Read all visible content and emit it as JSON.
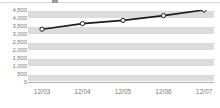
{
  "chart_data": {
    "type": "line",
    "title": "",
    "xlabel": "",
    "ylabel": "",
    "categories": [
      "12/03",
      "12/04",
      "12/05",
      "12/06",
      "12/07"
    ],
    "values": [
      3300,
      3650,
      3850,
      4150,
      4500
    ],
    "series": [
      {
        "name": "",
        "values": [
          3300,
          3650,
          3850,
          4150,
          4500
        ]
      }
    ],
    "ylim": [
      0,
      4500
    ],
    "ytick_labels": [
      "4,500",
      "4,000",
      "3,500",
      "3,000",
      "2,500",
      "2,000",
      "1,500",
      "1,000",
      "500",
      "0"
    ],
    "ytick_values": [
      4500,
      4000,
      3500,
      3000,
      2500,
      2000,
      1500,
      1000,
      500,
      0
    ],
    "grid": true,
    "grid_style": "horizontal-banded",
    "legend": "none",
    "marker": "open-circle",
    "colors": {
      "line": "#1c1c1c",
      "marker_fill": "#ffffff",
      "band": "#dcdcdc",
      "plot_background": "#ffffff",
      "tick_label": "#7a7a7a",
      "axis": "#b0b0b0"
    }
  }
}
